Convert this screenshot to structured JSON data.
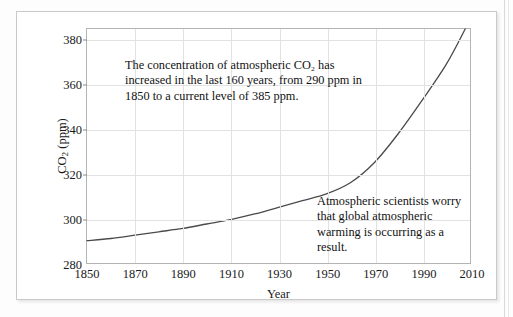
{
  "figure": {
    "annotations": [
      {
        "id": "concentration-note",
        "text": "The concentration of atmospheric CO₂ has increased in the last 160 years, from 290 ppm in 1850 to a current level of 385 ppm."
      },
      {
        "id": "warming-note",
        "text": "Atmospheric scientists worry that global atmospheric warming is occurring as a result."
      }
    ]
  },
  "chart_data": {
    "type": "line",
    "title": "",
    "xlabel": "Year",
    "ylabel": "CO₂ (ppm)",
    "xlim": [
      1850,
      2010
    ],
    "ylim": [
      280,
      385
    ],
    "xticks": [
      1850,
      1870,
      1890,
      1910,
      1930,
      1950,
      1970,
      1990,
      2010
    ],
    "yticks": [
      280,
      300,
      320,
      340,
      360,
      380
    ],
    "grid": true,
    "legend": false,
    "line_color": "#4a4a4a",
    "series": [
      {
        "name": "Atmospheric CO2 concentration",
        "x": [
          1850,
          1860,
          1870,
          1880,
          1890,
          1900,
          1910,
          1920,
          1930,
          1940,
          1950,
          1960,
          1970,
          1980,
          1990,
          2000,
          2008
        ],
        "values": [
          290,
          291,
          292.5,
          294,
          295.5,
          297.5,
          299.5,
          302,
          305,
          308,
          311,
          316,
          325,
          338,
          353,
          369,
          385
        ]
      }
    ],
    "annotations": [
      {
        "text": "The concentration of atmospheric CO2 has increased in the last 160 years, from 290 ppm in 1850 to a current level of 385 ppm.",
        "x": 1872,
        "y": 368
      },
      {
        "text": "Atmospheric scientists worry that global atmospheric warming is occurring as a result.",
        "x": 1952,
        "y": 306
      }
    ]
  }
}
